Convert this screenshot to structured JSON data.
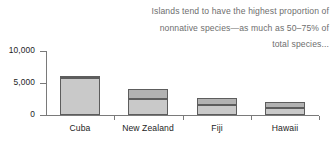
{
  "annotation": {
    "lines": [
      "Islands tend to have the highest proportion of",
      "nonnative species—as much as 50–75% of",
      "total species..."
    ],
    "color": "#6e6e6e"
  },
  "chart_data": {
    "type": "bar",
    "title": "",
    "xlabel": "",
    "ylabel": "",
    "stacked": true,
    "grid": false,
    "legend": "none",
    "categories": [
      "Cuba",
      "New Zealand",
      "Fiji",
      "Hawaii"
    ],
    "ylim": [
      0,
      10000
    ],
    "yticks": [
      0,
      5000,
      10000
    ],
    "ytick_labels": [
      "0",
      "5,000",
      "10,000"
    ],
    "series": [
      {
        "name": "native species",
        "color": "#c9c9c9",
        "values": [
          5800,
          2500,
          1500,
          1100
        ]
      },
      {
        "name": "nonnative species",
        "color": "#b2b2b2",
        "values": [
          350,
          1600,
          1100,
          950
        ]
      }
    ],
    "totals": [
      6150,
      4100,
      2600,
      2050
    ]
  },
  "style": {
    "axis_color": "#7a7a7a",
    "bar_edge_color": "#5d5d5d",
    "text_color": "#1d1d1d",
    "background": "#ffffff"
  }
}
